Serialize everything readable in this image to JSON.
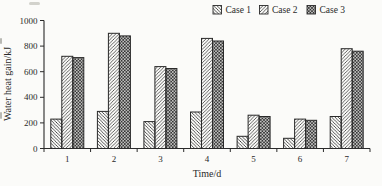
{
  "page": {
    "background": "#fbfbf9",
    "ink": "#2a2a2a"
  },
  "chart_data": {
    "type": "bar",
    "title": "",
    "xlabel": "Time/d",
    "ylabel": "Water heat gain/kJ",
    "categories": [
      "1",
      "2",
      "3",
      "4",
      "5",
      "6",
      "7"
    ],
    "series": [
      {
        "name": "Case 1",
        "pattern": "diagonal-backslash-hatch",
        "values": [
          230,
          290,
          210,
          285,
          95,
          80,
          250
        ]
      },
      {
        "name": "Case 2",
        "pattern": "diagonal-slash-hatch",
        "values": [
          720,
          900,
          640,
          860,
          260,
          230,
          780
        ]
      },
      {
        "name": "Case 3",
        "pattern": "crosshatch",
        "values": [
          710,
          880,
          625,
          840,
          250,
          220,
          760
        ]
      }
    ],
    "ylim": [
      0,
      1000
    ],
    "yticks": [
      0,
      200,
      400,
      600,
      800,
      1000
    ],
    "legend_position": "top",
    "grid": false
  }
}
